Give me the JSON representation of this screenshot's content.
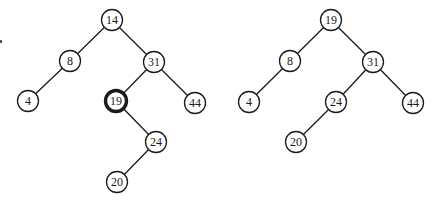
{
  "style": {
    "background": "#ffffff",
    "stroke": "#1a1a1a",
    "node_fill": "#ffffff",
    "node_radius": 10.5,
    "edge_width": 1.3,
    "node_stroke_width": 1.3,
    "highlight_stroke_width": 3.4,
    "font_size": 12
  },
  "trees": [
    {
      "id": "before",
      "label": "BST before deletion",
      "nodes": [
        {
          "id": "n14",
          "value": "14",
          "x": 112,
          "y": 20,
          "highlight": false
        },
        {
          "id": "n8",
          "value": "8",
          "x": 70,
          "y": 61,
          "highlight": false
        },
        {
          "id": "n31",
          "value": "31",
          "x": 154,
          "y": 62,
          "highlight": false
        },
        {
          "id": "n4",
          "value": "4",
          "x": 28,
          "y": 101,
          "highlight": false
        },
        {
          "id": "n19",
          "value": "19",
          "x": 116,
          "y": 101,
          "highlight": true
        },
        {
          "id": "n44",
          "value": "44",
          "x": 195,
          "y": 103,
          "highlight": false
        },
        {
          "id": "n24",
          "value": "24",
          "x": 156,
          "y": 142,
          "highlight": false
        },
        {
          "id": "n20",
          "value": "20",
          "x": 117,
          "y": 182,
          "highlight": false
        }
      ],
      "edges": [
        [
          "n14",
          "n8"
        ],
        [
          "n14",
          "n31"
        ],
        [
          "n8",
          "n4"
        ],
        [
          "n31",
          "n19"
        ],
        [
          "n31",
          "n44"
        ],
        [
          "n19",
          "n24"
        ],
        [
          "n24",
          "n20"
        ]
      ]
    },
    {
      "id": "after",
      "label": "BST after deletion",
      "nodes": [
        {
          "id": "m19",
          "value": "19",
          "x": 331,
          "y": 20,
          "highlight": false
        },
        {
          "id": "m8",
          "value": "8",
          "x": 290,
          "y": 61,
          "highlight": false
        },
        {
          "id": "m31",
          "value": "31",
          "x": 373,
          "y": 62,
          "highlight": false
        },
        {
          "id": "m4",
          "value": "4",
          "x": 249,
          "y": 102,
          "highlight": false
        },
        {
          "id": "m24",
          "value": "24",
          "x": 336,
          "y": 102,
          "highlight": false
        },
        {
          "id": "m44",
          "value": "44",
          "x": 413,
          "y": 103,
          "highlight": false
        },
        {
          "id": "m20",
          "value": "20",
          "x": 296,
          "y": 142,
          "highlight": false
        }
      ],
      "edges": [
        [
          "m19",
          "m8"
        ],
        [
          "m19",
          "m31"
        ],
        [
          "m8",
          "m4"
        ],
        [
          "m31",
          "m24"
        ],
        [
          "m31",
          "m44"
        ],
        [
          "m24",
          "m20"
        ]
      ]
    }
  ]
}
